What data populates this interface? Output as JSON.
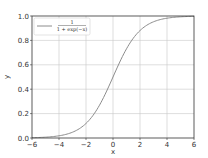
{
  "chart_data": {
    "type": "line",
    "title": "",
    "xlabel": "x",
    "ylabel": "y",
    "xlim": [
      -6,
      6
    ],
    "ylim": [
      0,
      1
    ],
    "xticks": [
      -6,
      -4,
      -2,
      0,
      2,
      4,
      6
    ],
    "xtick_labels": [
      "−6",
      "−4",
      "−2",
      "0",
      "2",
      "4",
      "6"
    ],
    "yticks": [
      0.0,
      0.2,
      0.4,
      0.6,
      0.8,
      1.0
    ],
    "ytick_labels": [
      "0.0",
      "0.2",
      "0.4",
      "0.6",
      "0.8",
      "1.0"
    ],
    "grid": true,
    "legend_position": "upper left",
    "series": [
      {
        "name": "1 / (1 + exp(−x))",
        "legend_numerator": "1",
        "legend_denominator": "1 + exp(−x)",
        "color": "#8c8c8c",
        "x": [
          -6,
          -5,
          -4,
          -3,
          -2,
          -1,
          0,
          1,
          2,
          3,
          4,
          5,
          6
        ],
        "y": [
          0.0025,
          0.0067,
          0.018,
          0.047,
          0.119,
          0.269,
          0.5,
          0.731,
          0.881,
          0.953,
          0.982,
          0.9933,
          0.9975
        ]
      }
    ]
  },
  "colors": {
    "axis": "#333333",
    "grid": "#c8c8c8",
    "line": "#8c8c8c"
  }
}
